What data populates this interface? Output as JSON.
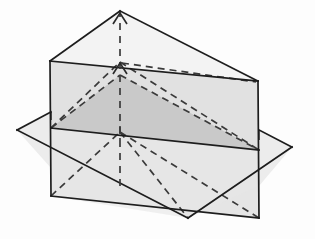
{
  "figure": {
    "title": "Triangular prism intersected by a horizontal plane",
    "canvas": {
      "width": 315,
      "height": 239,
      "background": "#fdfdfd"
    },
    "colors": {
      "stroke": "#1d1d1d",
      "hidden_stroke": "#3a3a3a",
      "face_light": "#efefef",
      "face_mid": "#e2e2e2",
      "face_dark": "#c9c9c9",
      "face_plane": "#e8e8e8",
      "background": "#fdfdfd"
    },
    "stroke_widths": {
      "solid": 1.7,
      "hidden": 1.7
    },
    "hidden_dash_pattern": "7 5"
  },
  "geometry": {
    "points": {
      "apex_top": [
        120,
        11
      ],
      "prism_top_left": [
        50,
        61
      ],
      "prism_top_right": [
        258,
        81
      ],
      "prism_bottom_left": [
        51,
        196
      ],
      "prism_bottom_right": [
        259,
        218
      ],
      "plane_left_vertex": [
        17,
        130
      ],
      "plane_right_vertex": [
        292,
        147
      ],
      "plane_front_vertex": [
        188,
        218
      ],
      "face_mid_left": [
        51,
        128
      ],
      "face_mid_right": [
        259,
        150
      ],
      "inner_apex": [
        120,
        75
      ],
      "centre_axis_top": [
        120,
        11
      ],
      "centre_axis_bottom": [
        120,
        186
      ]
    },
    "faces": [
      {
        "name": "prism-roof-left",
        "polygon": "120,11 50,61 258,81",
        "fill": "#f3f3f3"
      },
      {
        "name": "vertical-face-upper",
        "polygon": "50,61 258,81 259,150 51,128",
        "fill": "#e1e1e1"
      },
      {
        "name": "inner-triangle-shaded",
        "polygon": "51,128 120,75 259,150",
        "fill": "#c9c9c9"
      },
      {
        "name": "vertical-face-lower",
        "polygon": "51,128 259,150 259,218 51,196",
        "fill": "#e6e6e6"
      },
      {
        "name": "cutting-plane",
        "polygon": "17,130 188,218 292,147 120,75",
        "fill": "#e8e8e8"
      }
    ],
    "solid_edges": [
      {
        "name": "roof-left-edge",
        "path": "M120,11 L50,61"
      },
      {
        "name": "roof-right-edge",
        "path": "M120,11 L258,81"
      },
      {
        "name": "prism-top-edge",
        "path": "M50,61 L258,81"
      },
      {
        "name": "prism-left-edge",
        "path": "M50,61 L51,196"
      },
      {
        "name": "prism-right-edge",
        "path": "M258,81 L259,218"
      },
      {
        "name": "prism-bottom-edge",
        "path": "M51,196 L259,218"
      },
      {
        "name": "face-mid-line",
        "path": "M51,128 L259,150"
      },
      {
        "name": "plane-edge-left-back",
        "path": "M17,130 L120,75"
      },
      {
        "name": "plane-edge-right-back",
        "path": "M120,75 L292,147"
      },
      {
        "name": "plane-edge-left-front",
        "path": "M17,130 L188,218"
      },
      {
        "name": "plane-edge-right-front",
        "path": "M188,218 L292,147"
      }
    ],
    "hidden_edges": [
      {
        "name": "hidden-base-left",
        "path": "M51,128 L120,75"
      },
      {
        "name": "hidden-base-right",
        "path": "M120,75 L259,150"
      },
      {
        "name": "hidden-diagonal-upper-left",
        "path": "M51,128 L120,62"
      },
      {
        "name": "hidden-diagonal-upper-right",
        "path": "M120,62 L259,150"
      },
      {
        "name": "hidden-back-top-edge",
        "path": "M120,62 L258,81"
      },
      {
        "name": "hidden-lower-left-fan",
        "path": "M51,196 L120,132"
      },
      {
        "name": "hidden-lower-right-fan",
        "path": "M120,132 L259,218"
      },
      {
        "name": "hidden-lower-diagonal",
        "path": "M120,132 L188,218"
      }
    ],
    "axis": {
      "name": "vertical-axis",
      "path": "M120,186 L120,11",
      "arrowheads": [
        {
          "name": "axis-arrowhead-upper",
          "tip": [
            120,
            14
          ],
          "size": 9
        },
        {
          "name": "axis-arrowhead-lower",
          "tip": [
            120,
            63
          ],
          "size": 9
        }
      ]
    }
  }
}
